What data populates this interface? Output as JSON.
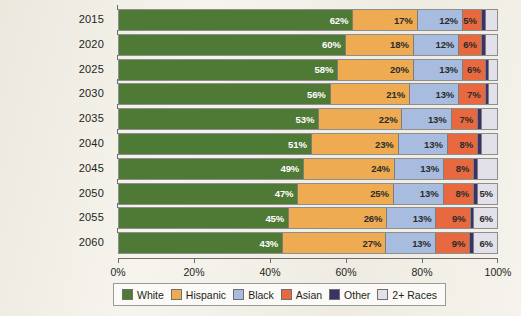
{
  "chart_data": {
    "type": "bar",
    "orientation": "horizontal",
    "stacked": true,
    "stack_mode": "percent",
    "title": "",
    "subtitle": "",
    "xlabel": "",
    "ylabel": "",
    "xlim": [
      0,
      100
    ],
    "grid": false,
    "legend_position": "bottom",
    "categories": [
      "2015",
      "2020",
      "2025",
      "2030",
      "2035",
      "2040",
      "2045",
      "2050",
      "2055",
      "2060"
    ],
    "x_tick_labels": [
      "0%",
      "20%",
      "40%",
      "60%",
      "80%",
      "100%"
    ],
    "x_tick_values": [
      0,
      20,
      40,
      60,
      80,
      100
    ],
    "series": [
      {
        "name": "White",
        "color": "#4e7a36",
        "label_color": "light",
        "values": [
          62,
          60,
          58,
          56,
          53,
          51,
          49,
          47,
          45,
          43
        ],
        "labels": [
          "62%",
          "60%",
          "58%",
          "56%",
          "53%",
          "51%",
          "49%",
          "47%",
          "45%",
          "43%"
        ]
      },
      {
        "name": "Hispanic",
        "color": "#eeab51",
        "label_color": "dark",
        "values": [
          17,
          18,
          20,
          21,
          22,
          23,
          24,
          25,
          26,
          27
        ],
        "labels": [
          "17%",
          "18%",
          "20%",
          "21%",
          "22%",
          "23%",
          "24%",
          "25%",
          "26%",
          "27%"
        ]
      },
      {
        "name": "Black",
        "color": "#a8bcdf",
        "label_color": "dark",
        "values": [
          12,
          12,
          13,
          13,
          13,
          13,
          13,
          13,
          13,
          13
        ],
        "labels": [
          "12%",
          "12%",
          "13%",
          "13%",
          "13%",
          "13%",
          "13%",
          "13%",
          "13%",
          "13%"
        ]
      },
      {
        "name": "Asian",
        "color": "#e8693f",
        "label_color": "dark",
        "values": [
          5,
          6,
          6,
          7,
          7,
          8,
          8,
          8,
          9,
          9
        ],
        "labels": [
          "5%",
          "6%",
          "6%",
          "7%",
          "7%",
          "8%",
          "8%",
          "8%",
          "9%",
          "9%"
        ]
      },
      {
        "name": "Other",
        "color": "#3a3269",
        "label_color": "light",
        "values": [
          1,
          1,
          1,
          1,
          1,
          1,
          1,
          1,
          1,
          1
        ],
        "labels": [
          "",
          "",
          "",
          "",
          "",
          "",
          "",
          "",
          "",
          ""
        ]
      },
      {
        "name": "2+ Races",
        "color": "#e2e1ea",
        "label_color": "dark",
        "values": [
          3,
          3,
          2,
          2,
          4,
          4,
          5,
          5,
          6,
          6
        ],
        "labels": [
          "",
          "",
          "",
          "",
          "",
          "",
          "",
          "5%",
          "6%",
          "6%"
        ]
      }
    ]
  },
  "legend": {
    "items": [
      {
        "label": "White",
        "color": "#4e7a36"
      },
      {
        "label": "Hispanic",
        "color": "#eeab51"
      },
      {
        "label": "Black",
        "color": "#a8bcdf"
      },
      {
        "label": "Asian",
        "color": "#e8693f"
      },
      {
        "label": "Other",
        "color": "#3a3269"
      },
      {
        "label": "2+ Races",
        "color": "#e2e1ea"
      }
    ]
  }
}
